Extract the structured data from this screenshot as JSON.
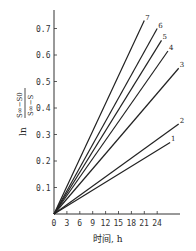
{
  "chart_data": {
    "type": "line",
    "title": "",
    "xlabel": "时间, h",
    "ylabel": "ln (S∞−S0)/(S∞−S)",
    "xlim": [
      0,
      30
    ],
    "ylim": [
      0,
      0.75
    ],
    "x_ticks": [
      "0",
      "3",
      "6",
      "9",
      "12",
      "15",
      "18",
      "21",
      "24"
    ],
    "y_ticks": [
      "0.1",
      "0.2",
      "0.3",
      "0.4",
      "0.5",
      "0.6",
      "0.7"
    ],
    "grid": false,
    "legend": "inline numeric labels at line ends",
    "series": [
      {
        "name": "1",
        "x": [
          0,
          27
        ],
        "y": [
          0,
          0.27
        ]
      },
      {
        "name": "2",
        "x": [
          0,
          29
        ],
        "y": [
          0,
          0.34
        ]
      },
      {
        "name": "3",
        "x": [
          0,
          29
        ],
        "y": [
          0,
          0.55
        ]
      },
      {
        "name": "4",
        "x": [
          0,
          26.5
        ],
        "y": [
          0,
          0.615
        ]
      },
      {
        "name": "5",
        "x": [
          0,
          25
        ],
        "y": [
          0,
          0.655
        ]
      },
      {
        "name": "6",
        "x": [
          0,
          24
        ],
        "y": [
          0,
          0.7
        ]
      },
      {
        "name": "7",
        "x": [
          0,
          21
        ],
        "y": [
          0,
          0.73
        ]
      }
    ]
  },
  "axis": {
    "xlabel": "时间, h",
    "ylabel_ln": "ln",
    "ylabel_num": "S∞−S0",
    "ylabel_den": "S∞−S"
  }
}
